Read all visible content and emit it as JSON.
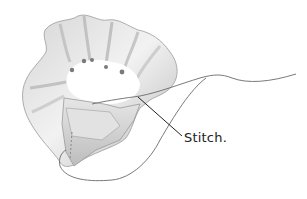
{
  "illustration": {
    "subject": "ribbon rosette with needle thread",
    "callout_label": "Stitch.",
    "colors": {
      "ribbon_light": "#eeeeee",
      "ribbon_mid": "#c9c9c9",
      "ribbon_dark": "#9a9a9a",
      "thread": "#6a6a6a",
      "leader_line": "#222222",
      "text": "#222222",
      "background": "#ffffff"
    }
  }
}
